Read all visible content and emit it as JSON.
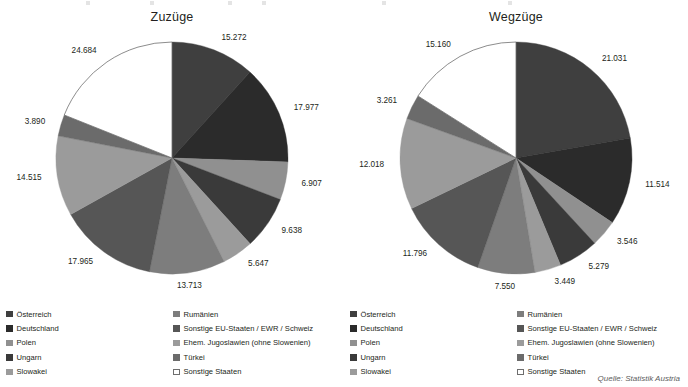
{
  "source_note": "Quelle: Statistik Austria",
  "legend": {
    "items": [
      {
        "label": "Österreich",
        "color": "#3f3f3f",
        "outline": false
      },
      {
        "label": "Deutschland",
        "color": "#2b2b2b",
        "outline": false
      },
      {
        "label": "Polen",
        "color": "#909090",
        "outline": false
      },
      {
        "label": "Ungarn",
        "color": "#3a3a3a",
        "outline": false
      },
      {
        "label": "Slowakei",
        "color": "#9b9b9b",
        "outline": false
      },
      {
        "label": "Rumänien",
        "color": "#7d7d7d",
        "outline": false
      },
      {
        "label": "Sonstige EU-Staaten / EWR / Schweiz",
        "color": "#565656",
        "outline": false
      },
      {
        "label": "Ehem. Jugoslawien (ohne Slowenien)",
        "color": "#9b9b9b",
        "outline": false
      },
      {
        "label": "Türkei",
        "color": "#6b6b6b",
        "outline": false
      },
      {
        "label": "Sonstige Staaten",
        "color": "#ffffff",
        "outline": true
      }
    ]
  },
  "chart_data": [
    {
      "type": "pie",
      "title": "Zuzüge",
      "categories": [
        "Österreich",
        "Deutschland",
        "Polen",
        "Ungarn",
        "Slowakei",
        "Rumänien",
        "Sonstige EU-Staaten / EWR / Schweiz",
        "Ehem. Jugoslawien (ohne Slowenien)",
        "Türkei",
        "Sonstige Staaten"
      ],
      "values": [
        15272,
        17977,
        6907,
        9638,
        5647,
        13713,
        17965,
        14515,
        3890,
        24684
      ],
      "labels": [
        "15.272",
        "17.977",
        "6.907",
        "9.638",
        "5.647",
        "13.713",
        "17.965",
        "14.515",
        "3.890",
        "24.684"
      ],
      "colors": [
        "#3f3f3f",
        "#2b2b2b",
        "#909090",
        "#3a3a3a",
        "#9b9b9b",
        "#7d7d7d",
        "#565656",
        "#9b9b9b",
        "#6b6b6b",
        "#ffffff"
      ],
      "start_angle": 0,
      "direction": "clockwise",
      "total": 130208
    },
    {
      "type": "pie",
      "title": "Wegzüge",
      "categories": [
        "Österreich",
        "Deutschland",
        "Polen",
        "Ungarn",
        "Slowakei",
        "Rumänien",
        "Sonstige EU-Staaten / EWR / Schweiz",
        "Ehem. Jugoslawien (ohne Slowenien)",
        "Türkei",
        "Sonstige Staaten"
      ],
      "values": [
        21031,
        11514,
        3546,
        5279,
        3449,
        7550,
        11796,
        12018,
        3261,
        15160
      ],
      "labels": [
        "21.031",
        "11.514",
        "3.546",
        "5.279",
        "3.449",
        "7.550",
        "11.796",
        "12.018",
        "3.261",
        "15.160"
      ],
      "colors": [
        "#3f3f3f",
        "#2b2b2b",
        "#909090",
        "#3a3a3a",
        "#9b9b9b",
        "#7d7d7d",
        "#565656",
        "#9b9b9b",
        "#6b6b6b",
        "#ffffff"
      ],
      "start_angle": 0,
      "direction": "clockwise",
      "total": 94604
    }
  ]
}
